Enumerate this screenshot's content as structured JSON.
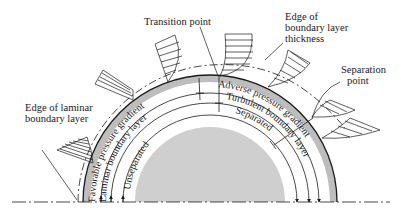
{
  "colors": {
    "ink": "#1a1a1a",
    "cylinder_fill": "#cfcfcf",
    "surface_band": "#bdbdbd",
    "background": "#ffffff"
  },
  "callouts": {
    "transition_point": "Transition point",
    "edge_bl_line1": "Edge of",
    "edge_bl_line2": "boundary layer",
    "edge_bl_line3": "thickness",
    "separation_line1": "Separation",
    "separation_line2": "point",
    "laminar_edge_line1": "Edge of laminar",
    "laminar_edge_line2": "boundary layer"
  },
  "arc_labels": {
    "favorable": "Favorable pressure gradient",
    "adverse": "Adverse pressure gradient",
    "laminar": "Laminar boundary layer",
    "turbulent": "Turbulent boundary layer",
    "unseparated": "Unseparated",
    "separated": "Separated"
  }
}
